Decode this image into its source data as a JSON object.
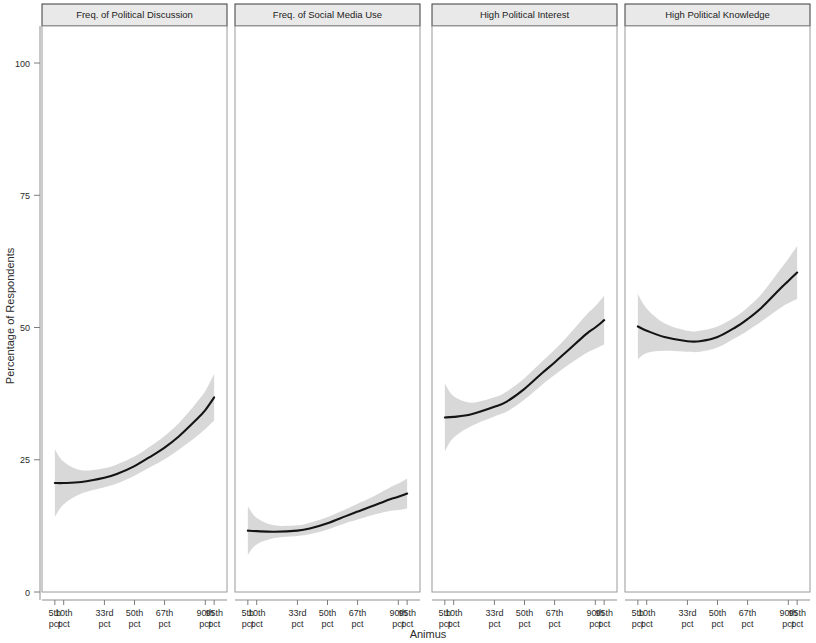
{
  "chart_data": {
    "type": "line",
    "title": "",
    "xlabel": "Animus",
    "ylabel": "Percentage of Respondents",
    "ylim": [
      0,
      107
    ],
    "yticks": [
      0,
      25,
      50,
      75,
      100
    ],
    "ytick_labels": [
      "0",
      "25",
      "50",
      "75",
      "100"
    ],
    "xlim": [
      0,
      100
    ],
    "xticks": [
      5,
      10,
      33,
      50,
      67,
      90,
      95
    ],
    "xtick_labels": [
      "5th\npct",
      "10th\npct",
      "33rd\npct",
      "50th\npct",
      "67th\npct",
      "90th\npct",
      "95th\npct"
    ],
    "xtick_labels_line1": [
      "5th",
      "10th",
      "33rd",
      "50th",
      "67th",
      "90th",
      "95th"
    ],
    "xtick_labels_line2": [
      "pct",
      "pct",
      "pct",
      "pct",
      "pct",
      "pct",
      "pct"
    ],
    "grid": false,
    "legend": "none",
    "line_color": "#141414",
    "band_color": "#d6d6d6",
    "strip_color": "#e9e9e9",
    "panels": [
      {
        "label": "Freq. of Political Discussion",
        "x": [
          5,
          10,
          20,
          33,
          40,
          50,
          60,
          67,
          75,
          85,
          90,
          95
        ],
        "fit": [
          20.6,
          20.6,
          20.8,
          21.6,
          22.3,
          23.8,
          25.8,
          27.3,
          29.4,
          32.6,
          34.4,
          36.8
        ],
        "lower": [
          14.2,
          16.6,
          18.6,
          19.8,
          20.5,
          22.0,
          23.8,
          25.1,
          26.9,
          29.4,
          30.8,
          32.4
        ],
        "upper": [
          27.0,
          24.6,
          23.0,
          23.4,
          24.1,
          25.6,
          27.8,
          29.5,
          31.9,
          35.8,
          38.0,
          41.2
        ]
      },
      {
        "label": "Freq. of Social Media Use",
        "x": [
          5,
          10,
          20,
          33,
          40,
          50,
          60,
          67,
          75,
          85,
          90,
          95
        ],
        "fit": [
          11.6,
          11.5,
          11.4,
          11.6,
          12.0,
          13.0,
          14.3,
          15.2,
          16.2,
          17.5,
          18.0,
          18.6
        ],
        "lower": [
          7.0,
          9.0,
          10.2,
          10.6,
          10.9,
          11.8,
          13.0,
          13.7,
          14.5,
          15.3,
          15.5,
          15.8
        ],
        "upper": [
          16.2,
          14.0,
          12.6,
          12.6,
          13.1,
          14.2,
          15.6,
          16.7,
          17.9,
          19.7,
          20.5,
          21.4
        ]
      },
      {
        "label": "High Political Interest",
        "x": [
          5,
          10,
          20,
          33,
          40,
          50,
          60,
          67,
          75,
          85,
          90,
          95
        ],
        "fit": [
          33.0,
          33.1,
          33.6,
          35.0,
          36.0,
          38.4,
          41.4,
          43.4,
          45.8,
          48.8,
          50.0,
          51.4
        ],
        "lower": [
          26.6,
          29.2,
          31.4,
          33.2,
          34.1,
          36.4,
          39.2,
          41.0,
          43.0,
          45.2,
          46.0,
          46.8
        ],
        "upper": [
          39.4,
          37.0,
          35.8,
          36.8,
          37.9,
          40.4,
          43.6,
          45.8,
          48.6,
          52.4,
          54.0,
          56.0
        ]
      },
      {
        "label": "High Political Knowledge",
        "x": [
          5,
          10,
          20,
          33,
          40,
          50,
          60,
          67,
          75,
          85,
          90,
          95
        ],
        "fit": [
          50.2,
          49.4,
          48.2,
          47.4,
          47.4,
          48.2,
          50.0,
          51.6,
          53.8,
          57.2,
          58.8,
          60.4
        ],
        "lower": [
          44.0,
          45.2,
          45.6,
          45.4,
          45.4,
          46.2,
          48.0,
          49.4,
          51.2,
          53.6,
          54.6,
          55.4
        ],
        "upper": [
          56.4,
          53.6,
          50.8,
          49.4,
          49.4,
          50.2,
          52.0,
          53.8,
          56.4,
          60.8,
          63.0,
          65.4
        ]
      }
    ]
  }
}
